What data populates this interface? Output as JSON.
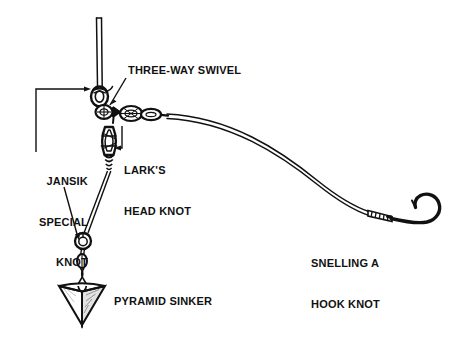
{
  "diagram": {
    "background_color": "#ffffff",
    "ink_color": "#111111",
    "width": 450,
    "height": 349
  },
  "labels": {
    "three_way_swivel": "THREE-WAY SWIVEL",
    "larks_head_knot_line1": "LARK'S",
    "larks_head_knot_line2": "HEAD KNOT",
    "jansik_line1": "JANSIK",
    "jansik_line2": "SPECIAL",
    "jansik_line3": "KNOT",
    "pyramid_sinker": "PYRAMID SINKER",
    "snelling_line1": "SNELLING A",
    "snelling_line2": "HOOK KNOT"
  },
  "components": {
    "main_line": "main-fishing-line",
    "swivel": "three-way-swivel",
    "leader": "leader-line",
    "hook": "fishing-hook",
    "sinker": "pyramid-sinker",
    "dropper_line": "sinker-dropper-line"
  }
}
